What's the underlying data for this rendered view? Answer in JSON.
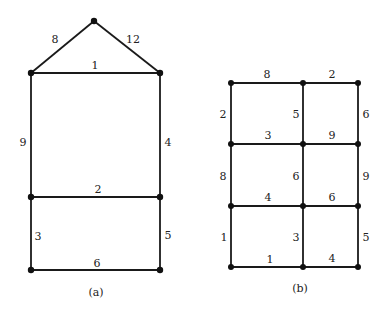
{
  "figure_a": {
    "caption": "(a)",
    "edge_labels": {
      "apex_left": "8",
      "apex_right": "12",
      "top": "1",
      "left_upper": "9",
      "right_upper": "4",
      "middle": "2",
      "left_lower": "3",
      "right_lower": "5",
      "bottom": "6"
    }
  },
  "figure_b": {
    "caption": "(b)",
    "edge_labels": {
      "row1_left": "8",
      "row1_right": "2",
      "row2_left": "3",
      "row2_right": "9",
      "row3_left": "4",
      "row3_right": "6",
      "row4_left": "1",
      "row4_right": "4",
      "col1_upper": "2",
      "col1_middle": "8",
      "col1_lower": "1",
      "col2_upper": "5",
      "col2_middle": "6",
      "col2_lower": "3",
      "col3_upper": "6",
      "col3_middle": "9",
      "col3_lower": "5"
    }
  }
}
